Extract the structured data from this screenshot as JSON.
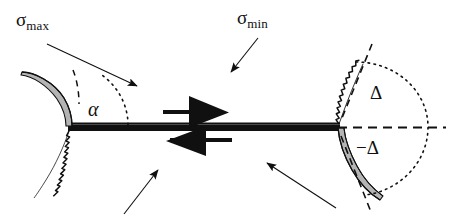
{
  "figure": {
    "kind": "fracture-mechanics-wing-crack-diagram",
    "background_color": "#ffffff",
    "ink_color": "#101010",
    "fill_gray": "#b4b4b4"
  },
  "labels": {
    "sigma_max": {
      "symbol": "σ",
      "subscript": "max"
    },
    "sigma_min": {
      "symbol": "σ",
      "subscript": "min"
    },
    "alpha": "α",
    "delta_positive": "Δ",
    "delta_negative": "−Δ"
  },
  "annotations": {
    "main_crack": "main-crack-horizontal-line",
    "shear_arrows": "shear-couple-double-arrow",
    "left_wing_upper": "left-upper-wing-crack",
    "left_wing_lower": "left-lower-rough-crack-branch",
    "right_wing_upper": "right-upper-rough-crack-branch",
    "right_wing_lower": "right-lower-wing-crack",
    "angle_arc_alpha": "dotted-arc-alpha",
    "delta_arc": "dotted-arc-delta-range",
    "delta_axis": "dashed-horizontal-reference-axis",
    "tangent_upper": "dashed-tangent-upper",
    "tangent_lower": "dashed-tangent-lower",
    "tangent_left": "dashed-tangent-left-wing"
  },
  "arrows": {
    "sigma_max_leader": "arrow-pointing-down-right",
    "sigma_min_leader": "arrow-pointing-down-left",
    "bottom_left_leader": "arrow-pointing-up-right",
    "bottom_right_leader": "arrow-pointing-up-left",
    "shear_top": "arrow-pointing-right",
    "shear_bottom": "arrow-pointing-left"
  }
}
